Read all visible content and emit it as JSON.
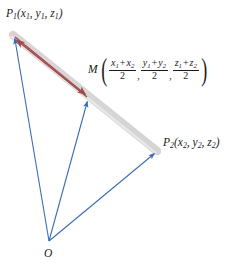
{
  "figure": {
    "background_color": "#ffffff",
    "width": 242,
    "height": 273,
    "colors": {
      "vector_blue": "#3a6cb5",
      "segment_red": "#9e4b4b",
      "band_gray": "#d3d3d3",
      "band_pink": "#dfd2d4",
      "label_text": "#1a1a1a"
    },
    "points": {
      "origin": {
        "name": "O",
        "label": "O",
        "x": 49,
        "y": 241
      },
      "p1": {
        "name": "P1",
        "x": 13,
        "y": 35
      },
      "p2": {
        "name": "P2",
        "x": 157,
        "y": 151
      },
      "m": {
        "name": "M",
        "x": 88,
        "y": 98
      }
    },
    "labels": {
      "p1": {
        "point": "P",
        "point_sub": "1",
        "open": "(",
        "coords": [
          {
            "var": "x",
            "sub": "1"
          },
          {
            "var": "y",
            "sub": "1"
          },
          {
            "var": "z",
            "sub": "1"
          }
        ],
        "close": ")",
        "separator": ","
      },
      "p2": {
        "point": "P",
        "point_sub": "2",
        "open": "(",
        "coords": [
          {
            "var": "x",
            "sub": "2"
          },
          {
            "var": "y",
            "sub": "2"
          },
          {
            "var": "z",
            "sub": "2"
          }
        ],
        "close": ")",
        "separator": ","
      },
      "m": {
        "point": "M",
        "open": "(",
        "close": ")",
        "separator": ",",
        "fractions": [
          {
            "numerator": [
              {
                "var": "x",
                "sub": "1"
              },
              {
                "op": "+"
              },
              {
                "var": "x",
                "sub": "2"
              }
            ],
            "denominator": "2"
          },
          {
            "numerator": [
              {
                "var": "y",
                "sub": "1"
              },
              {
                "op": "+"
              },
              {
                "var": "y",
                "sub": "2"
              }
            ],
            "denominator": "2"
          },
          {
            "numerator": [
              {
                "var": "z",
                "sub": "1"
              },
              {
                "op": "+"
              },
              {
                "var": "z",
                "sub": "2"
              }
            ],
            "denominator": "2"
          }
        ]
      },
      "origin": "O"
    },
    "vectors": [
      {
        "name": "O-to-P1",
        "from": "origin",
        "to": "p1",
        "color": "#3a6cb5",
        "arrowhead": true
      },
      {
        "name": "O-to-M",
        "from": "origin",
        "to": "m",
        "color": "#3a6cb5",
        "arrowhead": true
      },
      {
        "name": "O-to-P2",
        "from": "origin",
        "to": "p2",
        "color": "#3a6cb5",
        "arrowhead": true
      },
      {
        "name": "M-to-P1",
        "from": "m",
        "to": "p1",
        "color": "#9e4b4b",
        "arrowhead": true
      },
      {
        "name": "M-to-M",
        "from": "p1",
        "to": "m",
        "color": "#9e4b4b",
        "arrowhead": true
      }
    ],
    "band": {
      "name": "segment-P1-P2",
      "from": "p1",
      "through": "m",
      "to": "p2",
      "width": 8
    }
  }
}
